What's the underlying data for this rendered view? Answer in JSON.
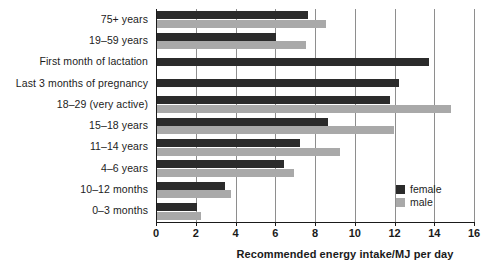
{
  "chart_data": {
    "type": "bar",
    "orientation": "horizontal",
    "title": "",
    "xlabel": "Recommended energy intake/MJ per day",
    "ylabel": "",
    "xlim": [
      0,
      16
    ],
    "xticks": [
      0,
      2,
      4,
      6,
      8,
      10,
      12,
      14,
      16
    ],
    "grid": true,
    "grid_axis": "x",
    "legend_position": "inside-right",
    "categories": [
      "75+ years",
      "19–59 years",
      "First month of lactation",
      "Last 3 months of pregnancy",
      "18–29 (very active)",
      "15–18 years",
      "11–14 years",
      "4–6 years",
      "10–12 months",
      "0–3 months"
    ],
    "series": [
      {
        "name": "female",
        "color": "#2b2b2b",
        "values": [
          7.6,
          6.0,
          13.7,
          12.2,
          11.7,
          8.6,
          7.2,
          6.4,
          3.4,
          2.0
        ]
      },
      {
        "name": "male",
        "color": "#a9a9a9",
        "values": [
          8.5,
          7.5,
          null,
          null,
          14.8,
          11.9,
          9.2,
          6.9,
          3.7,
          2.2
        ]
      }
    ]
  },
  "legend": {
    "items": [
      {
        "label": "female",
        "color": "#2b2b2b"
      },
      {
        "label": "male",
        "color": "#a9a9a9"
      }
    ]
  }
}
